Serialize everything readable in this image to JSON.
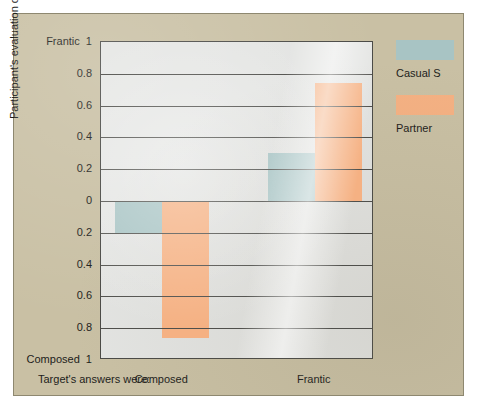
{
  "chart_data": {
    "type": "bar",
    "title": "",
    "subtitle": "",
    "xlabel": "Target's answers were:",
    "ylabel": "Participant's evaluation of the target",
    "categories": [
      "Composed",
      "Frantic"
    ],
    "series": [
      {
        "name": "Casual S",
        "color": "#a8c4c4",
        "values": [
          -0.2,
          0.3
        ]
      },
      {
        "name": "Partner",
        "color": "#f5b183",
        "values": [
          -0.86,
          0.74
        ]
      }
    ],
    "ylim": [
      -1,
      1
    ],
    "ytick_values": [
      1,
      0.8,
      0.6,
      0.4,
      0.2,
      0,
      -0.2,
      -0.4,
      -0.6,
      -0.8,
      -1
    ],
    "ytick_labels": [
      "1",
      "0.8",
      "0.6",
      "0.4",
      "0.2",
      "0",
      "0.2",
      "0.4",
      "0.6",
      "0.8",
      "1"
    ],
    "y_axis_top_anchor": "Frantic",
    "y_axis_bottom_anchor": "Composed",
    "grid": true,
    "legend_position": "right",
    "plot_background": "#e3e4e2",
    "panel_background": "#c9c0a4"
  },
  "yaxis": {
    "label": "Participant's evaluation of the target",
    "ticks": [
      {
        "label": "1",
        "anchor": "Frantic",
        "value": 1.0
      },
      {
        "label": "0.8",
        "anchor": "",
        "value": 0.8
      },
      {
        "label": "0.6",
        "anchor": "",
        "value": 0.6
      },
      {
        "label": "0.4",
        "anchor": "",
        "value": 0.4
      },
      {
        "label": "0.2",
        "anchor": "",
        "value": 0.2
      },
      {
        "label": "0",
        "anchor": "",
        "value": 0.0
      },
      {
        "label": "0.2",
        "anchor": "",
        "value": -0.2
      },
      {
        "label": "0.4",
        "anchor": "",
        "value": -0.4
      },
      {
        "label": "0.6",
        "anchor": "",
        "value": -0.6
      },
      {
        "label": "0.8",
        "anchor": "",
        "value": -0.8
      },
      {
        "label": "1",
        "anchor": "Composed",
        "value": -1.0
      }
    ],
    "top_label": "Frantic  1",
    "bottom_label": "Composed  1"
  },
  "xaxis": {
    "caption": "Target's answers were:",
    "ticks": [
      "Composed",
      "Frantic"
    ]
  },
  "legend": {
    "items": [
      {
        "label": "Casual S",
        "color": "#a8c4c4"
      },
      {
        "label": "Partner",
        "color": "#f5b183"
      }
    ]
  }
}
